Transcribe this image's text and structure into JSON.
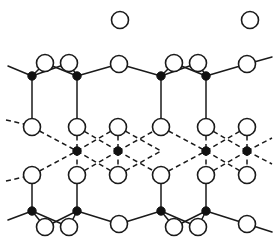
{
  "figure": {
    "background_color": "#ffffff",
    "line_color": "#1a1a1a",
    "filled_atom_color": "#111111",
    "open_atom_fill": "#ffffff"
  },
  "geometry": {
    "width": 276,
    "height": 251,
    "open_radius": 8.5,
    "filled_radius": 4.2,
    "solid_stroke_width": 1.5,
    "dashed_stroke_width": 1.5,
    "dash_pattern": "5 3.5"
  },
  "atoms": {
    "isolated_open": [
      {
        "id": "iso-1",
        "x": 120,
        "y": 20
      },
      {
        "id": "iso-2",
        "x": 250,
        "y": 20
      }
    ],
    "top_layer_filled": [
      {
        "id": "t-m1",
        "x": 32,
        "y": 76
      },
      {
        "id": "t-m2",
        "x": 77,
        "y": 76
      },
      {
        "id": "t-m3",
        "x": 161,
        "y": 76
      },
      {
        "id": "t-m4",
        "x": 206,
        "y": 76
      }
    ],
    "top_layer_open": [
      {
        "id": "t-o1",
        "x": 45,
        "y": 63
      },
      {
        "id": "t-o2",
        "x": 69,
        "y": 63
      },
      {
        "id": "t-o3",
        "x": 119,
        "y": 64
      },
      {
        "id": "t-o4",
        "x": 174,
        "y": 63
      },
      {
        "id": "t-o5",
        "x": 198,
        "y": 63
      },
      {
        "id": "t-o6",
        "x": 247,
        "y": 64
      }
    ],
    "upper_mid_open": [
      {
        "id": "um-1",
        "x": 32,
        "y": 127
      },
      {
        "id": "um-2",
        "x": 77,
        "y": 127
      },
      {
        "id": "um-3",
        "x": 118,
        "y": 127
      },
      {
        "id": "um-4",
        "x": 161,
        "y": 127
      },
      {
        "id": "um-5",
        "x": 206,
        "y": 127
      },
      {
        "id": "um-6",
        "x": 247,
        "y": 127
      }
    ],
    "middle_layer_filled": [
      {
        "id": "m-m1",
        "x": 77,
        "y": 151
      },
      {
        "id": "m-m2",
        "x": 118,
        "y": 151
      },
      {
        "id": "m-m3",
        "x": 206,
        "y": 151
      },
      {
        "id": "m-m4",
        "x": 247,
        "y": 151
      }
    ],
    "lower_mid_open": [
      {
        "id": "lm-1",
        "x": 32,
        "y": 175
      },
      {
        "id": "lm-2",
        "x": 77,
        "y": 175
      },
      {
        "id": "lm-3",
        "x": 118,
        "y": 175
      },
      {
        "id": "lm-4",
        "x": 161,
        "y": 175
      },
      {
        "id": "lm-5",
        "x": 206,
        "y": 175
      },
      {
        "id": "lm-6",
        "x": 247,
        "y": 175
      }
    ],
    "bottom_layer_filled": [
      {
        "id": "b-m1",
        "x": 32,
        "y": 211
      },
      {
        "id": "b-m2",
        "x": 77,
        "y": 211
      },
      {
        "id": "b-m3",
        "x": 161,
        "y": 211
      },
      {
        "id": "b-m4",
        "x": 206,
        "y": 211
      }
    ],
    "bottom_layer_open": [
      {
        "id": "b-o1",
        "x": 45,
        "y": 227
      },
      {
        "id": "b-o2",
        "x": 69,
        "y": 227
      },
      {
        "id": "b-o3",
        "x": 119,
        "y": 224
      },
      {
        "id": "b-o4",
        "x": 174,
        "y": 227
      },
      {
        "id": "b-o5",
        "x": 198,
        "y": 227
      },
      {
        "id": "b-o6",
        "x": 247,
        "y": 224
      }
    ]
  },
  "bonds": {
    "top_solid_path": [
      "M 8 66 L 32 76",
      "M 32 76 L 45 63",
      "M 45 63 L 77 76",
      "M 32 76 L 69 63",
      "M 69 63 L 77 76",
      "M 77 76 L 119 64",
      "M 119 64 L 161 76",
      "M 161 76 L 174 63",
      "M 174 63 L 206 76",
      "M 161 76 L 198 63",
      "M 198 63 L 206 76",
      "M 206 76 L 247 64",
      "M 247 64 L 272 57"
    ],
    "top_vertical": [
      "M 32 76 L 32 119",
      "M 77 76 L 77 119",
      "M 161 76 L 161 119",
      "M 206 76 L 206 119"
    ],
    "middle_dashed": [
      "M 6 120 L 24 124",
      "M 32 127 L 77 151",
      "M 77 151 L 118 127",
      "M 118 127 L 161 151",
      "M 77 127 L 118 151",
      "M 118 151 L 161 127",
      "M 161 127 L 206 151",
      "M 206 151 L 247 127",
      "M 206 127 L 247 151",
      "M 247 151 L 272 138",
      "M 32 175 L 77 151",
      "M 77 151 L 118 175",
      "M 118 175 L 161 151",
      "M 77 175 L 118 151",
      "M 118 151 L 161 175",
      "M 161 175 L 206 151",
      "M 206 151 L 247 175",
      "M 206 175 L 247 151",
      "M 247 151 L 272 164",
      "M 6 181 L 24 177",
      "M 77 127 L 77 151",
      "M 118 127 L 118 151",
      "M 206 127 L 206 151",
      "M 247 127 L 247 151",
      "M 77 151 L 77 175",
      "M 118 151 L 118 175",
      "M 206 151 L 206 175",
      "M 247 151 L 247 175"
    ],
    "bottom_vertical": [
      "M 32 183 L 32 211",
      "M 77 183 L 77 211",
      "M 161 183 L 161 211",
      "M 206 183 L 206 211"
    ],
    "bottom_solid_path": [
      "M 8 220 L 32 211",
      "M 32 211 L 45 227",
      "M 45 227 L 77 211",
      "M 32 211 L 69 227",
      "M 69 227 L 77 211",
      "M 77 211 L 119 224",
      "M 119 224 L 161 211",
      "M 161 211 L 174 227",
      "M 174 227 L 206 211",
      "M 161 211 L 198 227",
      "M 198 227 L 206 211",
      "M 206 211 L 247 224",
      "M 247 224 L 272 232"
    ]
  }
}
